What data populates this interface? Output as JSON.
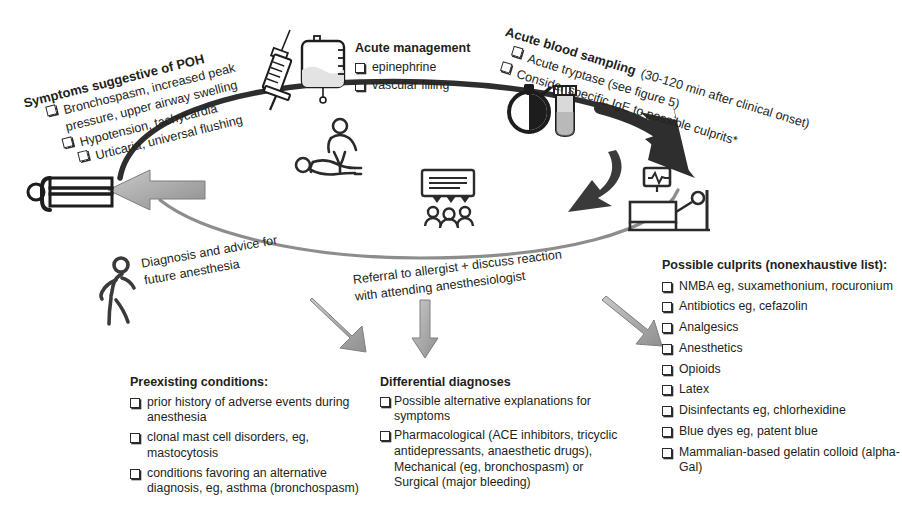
{
  "figure": {
    "type": "clinical-pathway-diagram"
  },
  "colors": {
    "ink": "#231f20",
    "arrow_dark": "#3b3b3b",
    "arrow_grey": "#9a9a9a",
    "ring": "#2f2f2f"
  },
  "blocks": {
    "symptoms": {
      "heading": "Symptoms suggestive of POH",
      "items": [
        "Bronchospasm, increased peak",
        "pressure, upper airway swelling",
        "Hypotension, tachycardia",
        "Urticaria, universal flushing"
      ],
      "item_has_checkbox": [
        true,
        false,
        true,
        true
      ]
    },
    "acute_management": {
      "heading": "Acute management",
      "items": [
        "epinephrine",
        "vascular filling"
      ]
    },
    "acute_blood_sampling": {
      "heading": "Acute blood sampling",
      "items": [
        "Acute tryptase (see figure 5)",
        "Consider specific IgE to possible culprits*"
      ],
      "heading_suffix": "(30-120 min after clinical onset)"
    },
    "diagnosis_advice": {
      "line1": "Diagnosis and advice for",
      "line2": "future anesthesia"
    },
    "referral": {
      "line1": "Referral to allergist + discuss reaction",
      "line2": "with attending anesthesiologist"
    },
    "preexisting": {
      "heading": "Preexisting conditions:",
      "items": [
        "prior history of adverse events during anesthesia",
        "clonal mast cell disorders, eg, mastocytosis",
        "conditions favoring an alternative diagnosis, eg, asthma (bronchospasm)"
      ]
    },
    "differential": {
      "heading": "Differential diagnoses",
      "items": [
        "Possible alternative  explanations for symptoms",
        "Pharmacological (ACE inhibitors, tricyclic antidepressants, anaesthetic drugs), Mechanical (eg, bronchospasm) or Surgical (major bleeding)"
      ]
    },
    "culprits": {
      "heading": "Possible culprits (nonexhaustive list):",
      "items": [
        "NMBA eg, suxamethonium, rocuronium",
        "Antibiotics eg, cefazolin",
        "Analgesics",
        "Anesthetics",
        "Opioids",
        "Latex",
        "Disinfectants eg, chlorhexidine",
        "Blue dyes eg, patent blue",
        "Mammalian-based gelatin colloid (alpha-Gal)"
      ]
    }
  },
  "icons": {
    "syringe": "syringe-icon",
    "iv_bag": "iv-bag-icon",
    "stopwatch": "stopwatch-icon",
    "blood_tube": "blood-collection-tube-icon",
    "cpr": "cpr-resuscitation-icon",
    "meeting": "team-discussion-icon",
    "patient_lying": "patient-lying-icon",
    "hospital_bed": "hospital-bed-monitor-icon",
    "walking_person": "walking-person-icon"
  }
}
